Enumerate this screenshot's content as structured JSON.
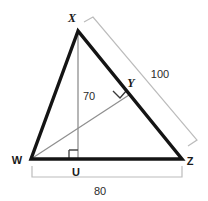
{
  "figure": {
    "type": "geometry-diagram",
    "shape": "triangle",
    "background_color": "#ffffff",
    "stroke_color_main": "#111111",
    "stroke_color_thin": "#8c8c8c",
    "text_color": "#1a1a1a"
  },
  "header": {
    "clipped_text": ""
  },
  "vertices": {
    "x": {
      "label": "X",
      "px": 78,
      "py": 31,
      "label_x": 72,
      "label_y": 22
    },
    "w": {
      "label": "W",
      "px": 31,
      "py": 159,
      "label_x": 13,
      "label_y": 163
    },
    "z": {
      "label": "Z",
      "px": 182,
      "py": 159,
      "label_x": 186,
      "label_y": 164
    },
    "y": {
      "label": "Y",
      "px": 129,
      "py": 95,
      "label_x": 128,
      "label_y": 86
    },
    "u": {
      "label": "U",
      "px": 78,
      "py": 159,
      "label_x": 73,
      "label_y": 174
    }
  },
  "segments": {
    "wx": {
      "name": "WX",
      "style": "thick-black"
    },
    "xz": {
      "name": "XZ",
      "style": "thick-black"
    },
    "wz": {
      "name": "WZ",
      "style": "thick-black"
    },
    "xu": {
      "name": "XU",
      "style": "thin-gray",
      "label": "70"
    },
    "wy": {
      "name": "WY",
      "style": "thin-gray"
    }
  },
  "measurements": [
    {
      "name": "altitude-xu",
      "value": "70",
      "label_x": 82,
      "label_y": 99
    },
    {
      "name": "side-xz",
      "value": "100",
      "label_x": 148,
      "label_y": 78
    },
    {
      "name": "base-wz",
      "value": "80",
      "label_x": 92,
      "label_y": 194
    }
  ],
  "right_angles": [
    {
      "name": "right-angle-at-u",
      "at": "U",
      "description": "XU perpendicular to WZ"
    },
    {
      "name": "right-angle-at-y",
      "at": "Y",
      "description": "WY perpendicular to XZ"
    }
  ],
  "brackets": {
    "side_bracket": {
      "name": "xz-measure-bracket",
      "label": "100"
    },
    "base_bracket": {
      "name": "wz-measure-bracket",
      "label": "80"
    }
  }
}
